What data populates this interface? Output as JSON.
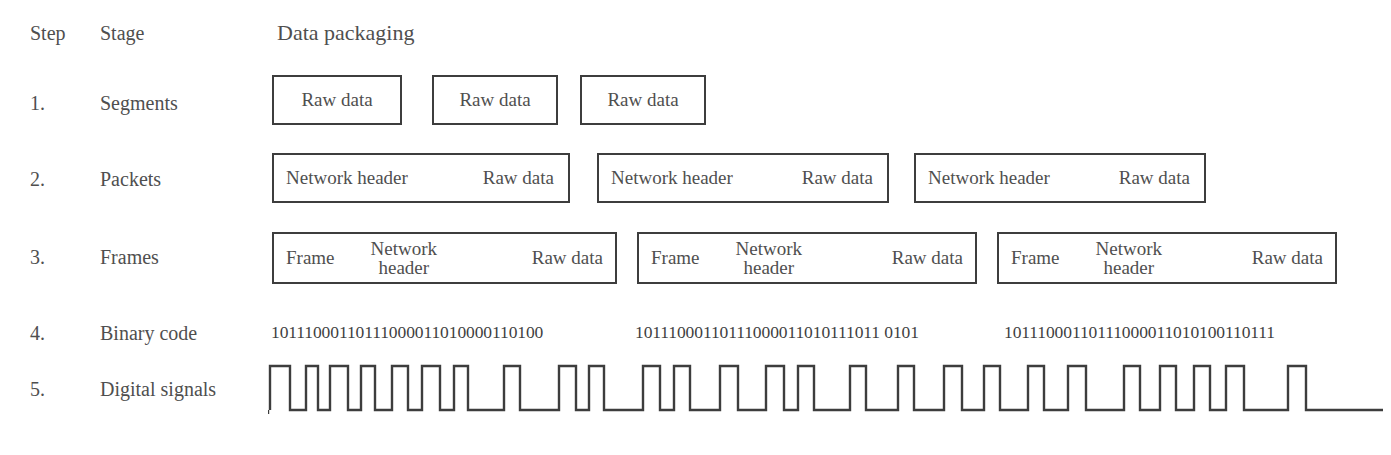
{
  "header": {
    "step": "Step",
    "stage": "Stage",
    "data_packaging": "Data packaging"
  },
  "labels": {
    "raw_data": "Raw data",
    "network_header": "Network header",
    "network_header_line1": "Network",
    "network_header_line2": "header",
    "frame": "Frame"
  },
  "rows": [
    {
      "step": "1.",
      "stage": "Segments",
      "boxes": [
        {
          "parts": [
            "Raw data"
          ]
        },
        {
          "parts": [
            "Raw data"
          ]
        },
        {
          "parts": [
            "Raw data"
          ]
        }
      ]
    },
    {
      "step": "2.",
      "stage": "Packets",
      "boxes": [
        {
          "parts": [
            "Network header",
            "Raw data"
          ]
        },
        {
          "parts": [
            "Network header",
            "Raw data"
          ]
        },
        {
          "parts": [
            "Network header",
            "Raw data"
          ]
        }
      ]
    },
    {
      "step": "3.",
      "stage": "Frames",
      "boxes": [
        {
          "parts": [
            "Frame",
            "Network header",
            "Raw data"
          ]
        },
        {
          "parts": [
            "Frame",
            "Network header",
            "Raw data"
          ]
        },
        {
          "parts": [
            "Frame",
            "Network header",
            "Raw data"
          ]
        }
      ]
    },
    {
      "step": "4.",
      "stage": "Binary code",
      "binary": [
        "10111000110111000011010000110100",
        "10111000110111000011010111011 0101",
        "10111000110111000011010100110111"
      ]
    },
    {
      "step": "5.",
      "stage": "Digital signals"
    }
  ],
  "colors": {
    "ink": "#4f4f4f",
    "stroke": "#3d3d3d",
    "background": "#ffffff"
  }
}
